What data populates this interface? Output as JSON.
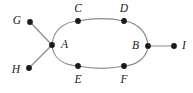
{
  "diagram": {
    "type": "undirected-graph",
    "background_color": "#ffffff",
    "edge_color": "#8a8a8a",
    "vertex_color": "#1a1a1a",
    "vertices": [
      {
        "id": "A",
        "label": "A",
        "x": 52,
        "y": 45,
        "label_x": 61,
        "label_y": 45,
        "label_anchor": "right",
        "dot_r": 2.9
      },
      {
        "id": "B",
        "label": "B",
        "x": 148,
        "y": 46,
        "label_x": 139,
        "label_y": 46,
        "label_anchor": "left",
        "dot_r": 2.9
      },
      {
        "id": "C",
        "label": "C",
        "x": 78,
        "y": 21,
        "label_x": 78,
        "label_y": 9,
        "label_anchor": "center",
        "dot_r": 2.9
      },
      {
        "id": "D",
        "label": "D",
        "x": 124,
        "y": 21,
        "label_x": 124,
        "label_y": 9,
        "label_anchor": "center",
        "dot_r": 2.9
      },
      {
        "id": "E",
        "label": "E",
        "x": 78,
        "y": 66,
        "label_x": 78,
        "label_y": 80,
        "label_anchor": "center",
        "dot_r": 2.9
      },
      {
        "id": "F",
        "label": "F",
        "x": 124,
        "y": 66,
        "label_x": 124,
        "label_y": 80,
        "label_anchor": "center",
        "dot_r": 2.9
      },
      {
        "id": "G",
        "label": "G",
        "x": 30,
        "y": 22,
        "label_x": 21,
        "label_y": 21,
        "label_anchor": "left",
        "dot_r": 2.9
      },
      {
        "id": "H",
        "label": "H",
        "x": 29,
        "y": 68,
        "label_x": 20,
        "label_y": 70,
        "label_anchor": "left",
        "dot_r": 2.9
      },
      {
        "id": "I",
        "label": "I",
        "x": 174,
        "y": 46,
        "label_x": 182,
        "label_y": 46,
        "label_anchor": "right",
        "dot_r": 2.9
      }
    ],
    "edges": [
      {
        "from": "G",
        "to": "A",
        "shape": "line",
        "path": "M 30 22 L 52 45"
      },
      {
        "from": "H",
        "to": "A",
        "shape": "line",
        "path": "M 29 68 L 52 45"
      },
      {
        "from": "B",
        "to": "I",
        "shape": "line",
        "path": "M 148 46 L 174 46"
      },
      {
        "from": "A",
        "to": "C",
        "shape": "arc",
        "path": "M 52 45 C 53 31 63 22 78 21"
      },
      {
        "from": "C",
        "to": "D",
        "shape": "arc",
        "path": "M 78 21 C 94 18 110 18 124 21"
      },
      {
        "from": "D",
        "to": "B",
        "shape": "arc",
        "path": "M 124 21 C 138 23 147 32 148 46"
      },
      {
        "from": "B",
        "to": "F",
        "shape": "arc",
        "path": "M 148 46 C 147 57 138 65 124 66"
      },
      {
        "from": "F",
        "to": "E",
        "shape": "arc",
        "path": "M 124 66 C 110 69 94 69 78 66"
      },
      {
        "from": "E",
        "to": "A",
        "shape": "arc",
        "path": "M 78 66 C 63 65 53 58 52 45"
      }
    ]
  }
}
